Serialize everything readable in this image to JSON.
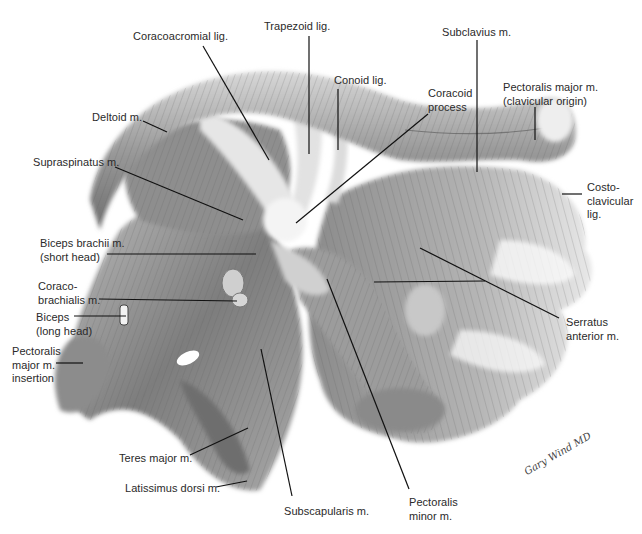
{
  "figure": {
    "type": "anatomical illustration",
    "signature": "Gary Wind MD"
  },
  "labels": [
    {
      "id": "coracoacromial-lig",
      "lines": [
        "Coracoacromial lig."
      ],
      "x": 133,
      "y": 30
    },
    {
      "id": "trapezoid-lig",
      "lines": [
        "Trapezoid lig."
      ],
      "x": 264,
      "y": 20
    },
    {
      "id": "subclavius-m",
      "lines": [
        "Subclavius m."
      ],
      "x": 442,
      "y": 26
    },
    {
      "id": "conoid-lig",
      "lines": [
        "Conoid lig."
      ],
      "x": 334,
      "y": 74
    },
    {
      "id": "coracoid-process",
      "lines": [
        "Coracoid",
        "process"
      ],
      "x": 428,
      "y": 87
    },
    {
      "id": "pectoralis-major-clavicular",
      "lines": [
        "Pectoralis major m.",
        "(clavicular origin)"
      ],
      "x": 503,
      "y": 81
    },
    {
      "id": "deltoid-m",
      "lines": [
        "Deltoid m."
      ],
      "x": 92,
      "y": 111
    },
    {
      "id": "supraspinatus-m",
      "lines": [
        "Supraspinatus m."
      ],
      "x": 33,
      "y": 156
    },
    {
      "id": "costo-clavicular-lig",
      "lines": [
        "Costo-",
        "clavicular",
        "lig."
      ],
      "x": 587,
      "y": 181
    },
    {
      "id": "biceps-brachii-short-head",
      "lines": [
        "Biceps brachii m.",
        "(short head)"
      ],
      "x": 40,
      "y": 237
    },
    {
      "id": "coracobrachialis-m",
      "lines": [
        "Coraco-",
        "brachialis m."
      ],
      "x": 38,
      "y": 280
    },
    {
      "id": "serratus-anterior-m",
      "lines": [
        "Serratus",
        "anterior m."
      ],
      "x": 566,
      "y": 316
    },
    {
      "id": "biceps-long-head",
      "lines": [
        "Biceps",
        "(long head)"
      ],
      "x": 36,
      "y": 311
    },
    {
      "id": "pectoralis-major-insertion",
      "lines": [
        "Pectoralis",
        "major m.",
        "insertion"
      ],
      "x": 12,
      "y": 345
    },
    {
      "id": "teres-major-m",
      "lines": [
        "Teres major m."
      ],
      "x": 119,
      "y": 452
    },
    {
      "id": "latissimus-dorsi-m",
      "lines": [
        "Latissimus dorsi m."
      ],
      "x": 125,
      "y": 482
    },
    {
      "id": "subscapularis-m",
      "lines": [
        "Subscapularis m."
      ],
      "x": 284,
      "y": 505
    },
    {
      "id": "pectoralis-minor-m",
      "lines": [
        "Pectoralis",
        "minor m."
      ],
      "x": 409,
      "y": 496
    }
  ],
  "leaders": [
    {
      "label": "coracoacromial-lig",
      "x1": 203,
      "y1": 46,
      "x2": 269,
      "y2": 160
    },
    {
      "label": "trapezoid-lig",
      "x1": 309,
      "y1": 36,
      "x2": 309,
      "y2": 154
    },
    {
      "label": "subclavius-m",
      "x1": 477,
      "y1": 40,
      "x2": 477,
      "y2": 172
    },
    {
      "label": "conoid-lig",
      "x1": 338,
      "y1": 89,
      "x2": 338,
      "y2": 150
    },
    {
      "label": "coracoid-process",
      "x1": 428,
      "y1": 114,
      "x2": 296,
      "y2": 223
    },
    {
      "label": "pectoralis-major-clavicular",
      "x1": 535,
      "y1": 107,
      "x2": 535,
      "y2": 140
    },
    {
      "label": "deltoid-m",
      "x1": 143,
      "y1": 121,
      "x2": 167,
      "y2": 132
    },
    {
      "label": "supraspinatus-m",
      "x1": 115,
      "y1": 167,
      "x2": 243,
      "y2": 220
    },
    {
      "label": "costo-clavicular-lig",
      "x1": 562,
      "y1": 194,
      "x2": 582,
      "y2": 194
    },
    {
      "label": "biceps-brachii-short-head",
      "x1": 107,
      "y1": 254,
      "x2": 256,
      "y2": 254
    },
    {
      "label": "coracobrachialis-m",
      "x1": 99,
      "y1": 299,
      "x2": 237,
      "y2": 301
    },
    {
      "label": "serratus-anterior-m",
      "x1": 559,
      "y1": 318,
      "x2": 420,
      "y2": 248
    },
    {
      "label": "serratus-anterior-m-2",
      "x1": 485,
      "y1": 281,
      "x2": 374,
      "y2": 282
    },
    {
      "label": "biceps-long-head",
      "x1": 74,
      "y1": 316,
      "x2": 126,
      "y2": 316
    },
    {
      "label": "pectoralis-major-insertion",
      "x1": 56,
      "y1": 363,
      "x2": 83,
      "y2": 363
    },
    {
      "label": "teres-major-m",
      "x1": 190,
      "y1": 455,
      "x2": 248,
      "y2": 428
    },
    {
      "label": "latissimus-dorsi-m",
      "x1": 216,
      "y1": 487,
      "x2": 247,
      "y2": 481
    },
    {
      "label": "subscapularis-m",
      "x1": 292,
      "y1": 496,
      "x2": 261,
      "y2": 349
    },
    {
      "label": "pectoralis-minor-m",
      "x1": 409,
      "y1": 489,
      "x2": 327,
      "y2": 279
    }
  ]
}
